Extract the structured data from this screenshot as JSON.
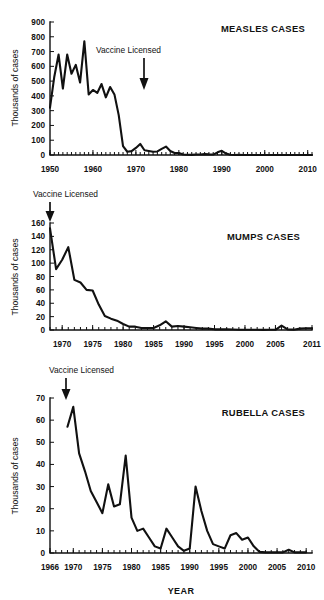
{
  "figure": {
    "xaxis_title": "YEAR",
    "panels": [
      "measles",
      "mumps",
      "rubella"
    ]
  },
  "chart_data": [
    {
      "id": "measles",
      "type": "line",
      "title": "MEASLES CASES",
      "xlabel": "",
      "ylabel": "Thousands of cases",
      "ylim": [
        0,
        900
      ],
      "xlim": [
        1950,
        2011
      ],
      "yticks": [
        0,
        100,
        200,
        300,
        400,
        500,
        600,
        700,
        800,
        900
      ],
      "xticks": [
        1950,
        1960,
        1970,
        1980,
        1990,
        2000,
        2010
      ],
      "xtick_labels": [
        "1950",
        "1960",
        "1970",
        "1980",
        "1990",
        "2000",
        "2010"
      ],
      "ytick_labels": [
        "0",
        "100",
        "200",
        "300",
        "400",
        "500",
        "600",
        "700",
        "800",
        "900"
      ],
      "grid": false,
      "legend": "none",
      "annotation": {
        "text": "Vaccine Licensed",
        "arrow_year": 1965,
        "arrow_from": 560,
        "arrow_to": 430
      },
      "x": [
        1950,
        1951,
        1952,
        1953,
        1954,
        1955,
        1956,
        1957,
        1958,
        1959,
        1960,
        1961,
        1962,
        1963,
        1964,
        1965,
        1966,
        1967,
        1968,
        1969,
        1970,
        1971,
        1972,
        1973,
        1974,
        1975,
        1976,
        1977,
        1978,
        1979,
        1980,
        1981,
        1982,
        1983,
        1984,
        1985,
        1986,
        1987,
        1988,
        1989,
        1990,
        1991,
        1992,
        1993,
        1994,
        1995,
        1996,
        1997,
        1998,
        1999,
        2000,
        2001,
        2002,
        2003,
        2004,
        2005,
        2006,
        2007,
        2008,
        2009,
        2010,
        2011
      ],
      "y": [
        320,
        530,
        680,
        450,
        680,
        550,
        610,
        490,
        770,
        410,
        440,
        420,
        480,
        390,
        460,
        410,
        270,
        60,
        22,
        26,
        48,
        75,
        32,
        27,
        22,
        24,
        41,
        57,
        27,
        14,
        14,
        3,
        2,
        1,
        3,
        3,
        6,
        4,
        3,
        18,
        28,
        10,
        2,
        0.3,
        1,
        0.3,
        0.5,
        0.1,
        0.1,
        0.1,
        0.1,
        0.1,
        0.04,
        0.06,
        0.04,
        0.07,
        0.06,
        0.04,
        0.14,
        0.07,
        0.06,
        0.22
      ],
      "units": "thousands of cases"
    },
    {
      "id": "mumps",
      "type": "line",
      "title": "MUMPS CASES",
      "xlabel": "",
      "ylabel": "Thousands of cases",
      "ylim": [
        0,
        160
      ],
      "xlim": [
        1968,
        2011
      ],
      "yticks": [
        0,
        20,
        40,
        60,
        80,
        100,
        120,
        140,
        160
      ],
      "xticks": [
        1970,
        1975,
        1980,
        1985,
        1990,
        1995,
        2000,
        2005,
        2011
      ],
      "xtick_labels": [
        "1970",
        "1975",
        "1980",
        "1985",
        "1990",
        "1995",
        "2000",
        "2005",
        "2011"
      ],
      "ytick_labels": [
        "0",
        "20",
        "40",
        "60",
        "80",
        "100",
        "120",
        "140",
        "160"
      ],
      "grid": false,
      "legend": "none",
      "annotation": {
        "text": "Vaccine Licensed",
        "arrow_year": 1968,
        "arrow_from": 200,
        "arrow_to": 162
      },
      "x": [
        1968,
        1969,
        1970,
        1971,
        1972,
        1973,
        1974,
        1975,
        1976,
        1977,
        1978,
        1979,
        1980,
        1981,
        1982,
        1983,
        1984,
        1985,
        1986,
        1987,
        1988,
        1989,
        1990,
        1991,
        1992,
        1993,
        1994,
        1995,
        1996,
        1997,
        1998,
        1999,
        2000,
        2001,
        2002,
        2003,
        2004,
        2005,
        2006,
        2007,
        2008,
        2009,
        2010,
        2011
      ],
      "y": [
        152,
        91,
        105,
        124,
        75,
        71,
        60,
        59,
        38,
        21,
        17,
        14,
        9,
        5,
        5,
        3,
        3,
        3,
        7,
        13,
        5,
        6,
        5,
        4,
        3,
        2,
        2,
        1,
        1,
        1,
        0.7,
        0.4,
        0.3,
        0.3,
        0.3,
        0.2,
        0.3,
        0.3,
        6.6,
        0.8,
        0.5,
        2,
        2.6,
        2.6
      ],
      "units": "thousands of cases"
    },
    {
      "id": "rubella",
      "type": "line",
      "title": "RUBELLA CASES",
      "xlabel": "YEAR",
      "ylabel": "Thousands of cases",
      "ylim": [
        0,
        70
      ],
      "xlim": [
        1966,
        2011
      ],
      "yticks": [
        0,
        10,
        20,
        30,
        40,
        50,
        60,
        70
      ],
      "xticks": [
        1966,
        1970,
        1975,
        1980,
        1985,
        1990,
        1995,
        2000,
        2005,
        2010
      ],
      "xtick_labels": [
        "1966",
        "1970",
        "1975",
        "1980",
        "1985",
        "1990",
        "1995",
        "2000",
        "2005",
        "2010"
      ],
      "ytick_labels": [
        "0",
        "10",
        "20",
        "30",
        "40",
        "50",
        "60",
        "70"
      ],
      "grid": false,
      "legend": "none",
      "annotation": {
        "text": "Vaccine Licensed",
        "arrow_year": 1969,
        "arrow_from": 74,
        "arrow_to": 62
      },
      "x": [
        1969,
        1970,
        1971,
        1972,
        1973,
        1974,
        1975,
        1976,
        1977,
        1978,
        1979,
        1980,
        1981,
        1982,
        1983,
        1984,
        1985,
        1986,
        1987,
        1988,
        1989,
        1990,
        1991,
        1992,
        1993,
        1994,
        1995,
        1996,
        1997,
        1998,
        1999,
        2000,
        2001,
        2002,
        2003,
        2004,
        2005,
        2006,
        2007,
        2008,
        2009,
        2010
      ],
      "y": [
        57,
        66,
        45,
        37,
        28,
        23,
        18,
        31,
        21,
        22,
        44,
        16,
        10,
        11,
        7,
        3,
        2,
        11,
        7,
        3,
        1,
        2,
        30,
        19,
        10,
        4,
        3,
        2,
        8,
        9,
        6,
        7,
        3,
        0.5,
        0.3,
        0.3,
        0.3,
        0.3,
        1.5,
        0.3,
        0.3,
        0.3
      ],
      "units": "thousands of cases"
    }
  ]
}
